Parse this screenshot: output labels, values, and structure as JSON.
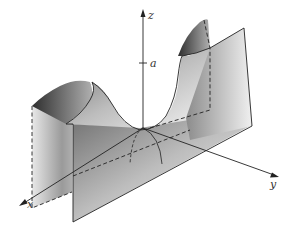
{
  "figure": {
    "type": "3d-surface",
    "axes": {
      "x": {
        "label": "x"
      },
      "y": {
        "label": "y"
      },
      "z": {
        "label": "z"
      }
    },
    "tick": {
      "label": "a"
    },
    "colors": {
      "line": "#222222",
      "surface_dark": "#3a3a3a",
      "surface_light": "#f2f2f2",
      "background": "#ffffff"
    }
  }
}
